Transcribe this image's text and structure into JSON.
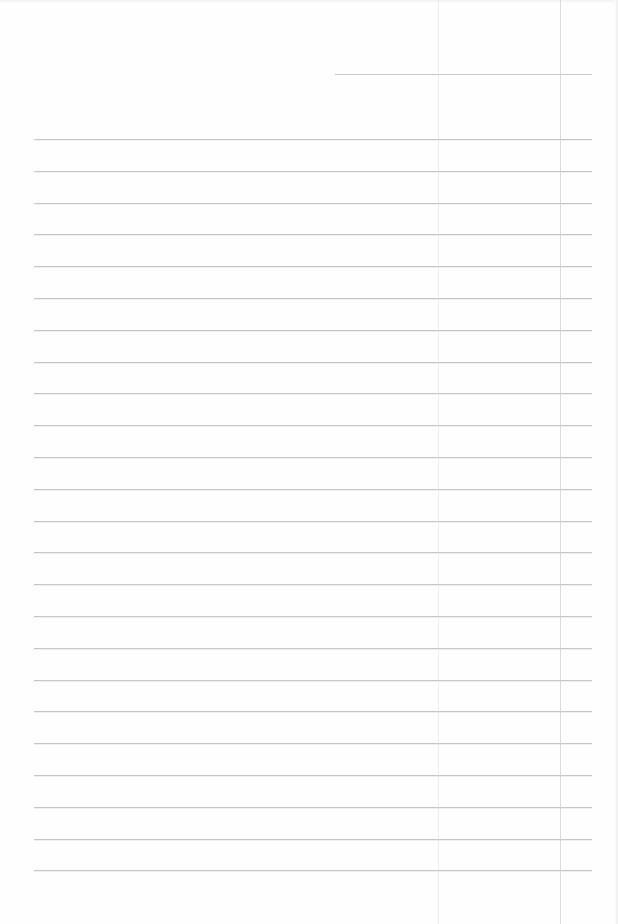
{
  "document": {
    "type": "lined-paper",
    "background_color": "#fefefe",
    "line_color": "#c6c6c6",
    "header_line": {
      "x_start": 335,
      "x_end": 592,
      "y": 74
    },
    "rules": {
      "count": 24,
      "x_start": 34,
      "x_end": 592,
      "y_first": 139,
      "spacing": 31.8
    },
    "vertical_marks": [
      {
        "x": 438,
        "style": "faint"
      },
      {
        "x": 560,
        "style": "stronger"
      }
    ],
    "text_content": []
  }
}
